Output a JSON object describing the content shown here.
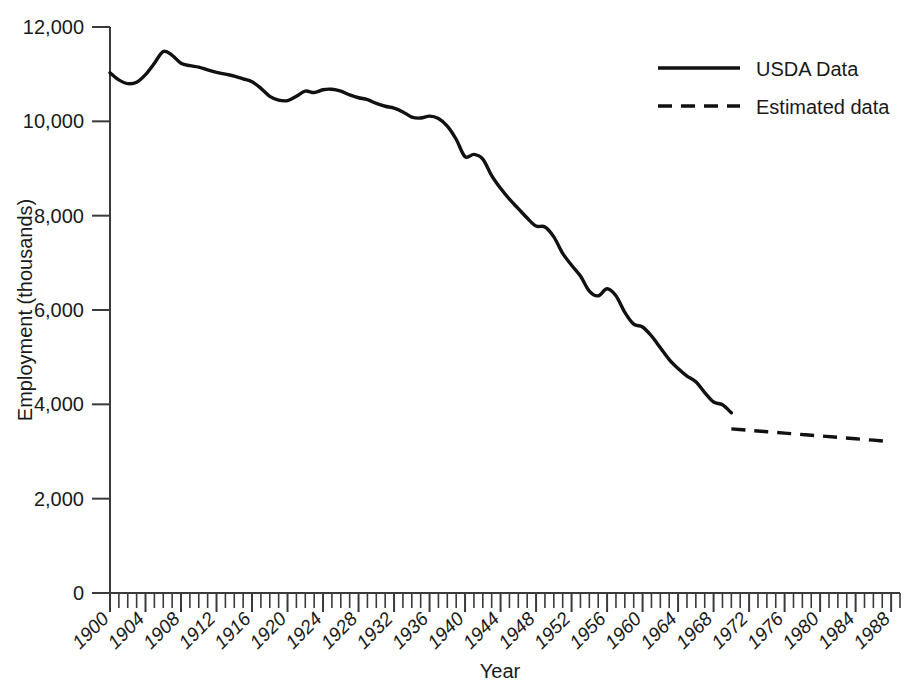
{
  "chart_data": {
    "type": "line",
    "title": "",
    "xlabel": "Year",
    "ylabel": "Employment (thousands)",
    "xlim": [
      1900,
      1989
    ],
    "ylim": [
      0,
      12000
    ],
    "grid": false,
    "legend_position": "top-right",
    "y_ticks": [
      0,
      2000,
      4000,
      6000,
      8000,
      10000,
      12000
    ],
    "y_tick_labels": [
      "0",
      "2,000",
      "4,000",
      "6,000",
      "8,000",
      "10,000",
      "12,000"
    ],
    "x_ticks": [
      1900,
      1904,
      1908,
      1912,
      1916,
      1920,
      1924,
      1928,
      1932,
      1936,
      1940,
      1944,
      1948,
      1952,
      1956,
      1960,
      1964,
      1968,
      1972,
      1976,
      1980,
      1984,
      1988
    ],
    "x_tick_labels": [
      "1900",
      "1904",
      "1908",
      "1912",
      "1916",
      "1920",
      "1924",
      "1928",
      "1932",
      "1936",
      "1940",
      "1944",
      "1948",
      "1952",
      "1956",
      "1960",
      "1964",
      "1968",
      "1972",
      "1976",
      "1980",
      "1984",
      "1988"
    ],
    "x_minor_tick_interval": 1,
    "series": [
      {
        "name": "USDA Data",
        "style": "solid",
        "color": "#111111",
        "x": [
          1900,
          1901,
          1902,
          1903,
          1904,
          1905,
          1906,
          1907,
          1908,
          1909,
          1910,
          1911,
          1912,
          1913,
          1914,
          1915,
          1916,
          1917,
          1918,
          1919,
          1920,
          1921,
          1922,
          1923,
          1924,
          1925,
          1926,
          1927,
          1928,
          1929,
          1930,
          1931,
          1932,
          1933,
          1934,
          1935,
          1936,
          1937,
          1938,
          1939,
          1940,
          1941,
          1942,
          1943,
          1944,
          1945,
          1946,
          1947,
          1948,
          1949,
          1950,
          1951,
          1952,
          1953,
          1954,
          1955,
          1956,
          1957,
          1958,
          1959,
          1960,
          1961,
          1962,
          1963,
          1964,
          1965,
          1966,
          1967,
          1968,
          1969,
          1970
        ],
        "y": [
          11030,
          10880,
          10800,
          10830,
          10990,
          11230,
          11480,
          11400,
          11230,
          11180,
          11150,
          11090,
          11040,
          11000,
          10960,
          10900,
          10840,
          10700,
          10530,
          10450,
          10440,
          10530,
          10640,
          10610,
          10670,
          10680,
          10640,
          10560,
          10500,
          10460,
          10380,
          10320,
          10280,
          10200,
          10090,
          10070,
          10110,
          10060,
          9900,
          9620,
          9250,
          9300,
          9200,
          8850,
          8580,
          8350,
          8150,
          7950,
          7780,
          7760,
          7550,
          7200,
          6950,
          6720,
          6400,
          6300,
          6450,
          6300,
          5950,
          5700,
          5640,
          5450,
          5200,
          4950,
          4760,
          4600,
          4480,
          4250,
          4050,
          3990,
          3820
        ]
      },
      {
        "name": "Estimated data",
        "style": "dashed",
        "color": "#111111",
        "x": [
          1970,
          1972,
          1974,
          1976,
          1978,
          1980,
          1982,
          1984,
          1986,
          1988
        ],
        "y": [
          3480,
          3450,
          3420,
          3390,
          3360,
          3330,
          3300,
          3270,
          3240,
          3210
        ]
      }
    ],
    "note": "Solid USDA series ends and the dashed estimated series begins at 1970 near 3,480 thousand."
  },
  "legend": {
    "items": [
      {
        "label": "USDA Data",
        "style": "solid"
      },
      {
        "label": "Estimated data",
        "style": "dashed"
      }
    ]
  },
  "axes": {
    "y_title": "Employment (thousands)",
    "x_title": "Year"
  }
}
